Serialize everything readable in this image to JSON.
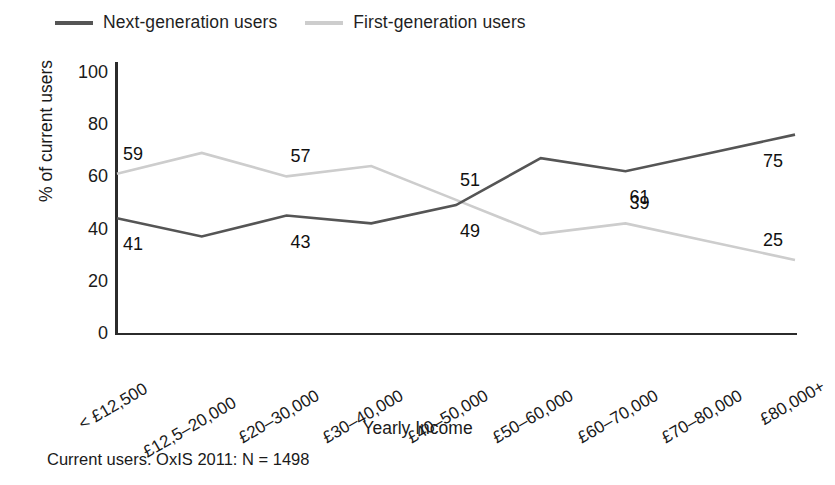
{
  "chart_data": {
    "type": "line",
    "title": "",
    "xlabel": "Yearly Income",
    "ylabel": "% of current users",
    "ylim": [
      0,
      100
    ],
    "yticks": [
      0,
      20,
      40,
      60,
      80,
      100
    ],
    "grid": false,
    "legend_position": "top-left",
    "categories": [
      "< £12,500",
      "£12,5–20,000",
      "£20–30,000",
      "£30–40,000",
      "£40–50,000",
      "£50–60,000",
      "£60–70,000",
      "£70–80,000",
      "£80,000+"
    ],
    "series": [
      {
        "name": "Next-generation users",
        "color": "#555555",
        "values": [
          44,
          37,
          45,
          42,
          49,
          67,
          62,
          69,
          76
        ],
        "labels": [
          {
            "index": 0,
            "text": "41"
          },
          {
            "index": 2,
            "text": "43"
          },
          {
            "index": 4,
            "text": "49"
          },
          {
            "index": 6,
            "text": "61"
          },
          {
            "index": 8,
            "text": "75"
          }
        ]
      },
      {
        "name": "First-generation users",
        "color": "#cdcdcd",
        "values": [
          61,
          69,
          60,
          64,
          51,
          38,
          42,
          35,
          28
        ],
        "labels": [
          {
            "index": 0,
            "text": "59"
          },
          {
            "index": 2,
            "text": "57"
          },
          {
            "index": 4,
            "text": "51"
          },
          {
            "index": 6,
            "text": "39"
          },
          {
            "index": 8,
            "text": "25"
          }
        ]
      }
    ],
    "annotations": [
      {
        "name": "footnote",
        "text": "Current users. OxIS 2011: N = 1498"
      }
    ]
  },
  "legend": {
    "entries": [
      {
        "label": "Next-generation users",
        "color": "#555555"
      },
      {
        "label": "First-generation users",
        "color": "#cdcdcd"
      }
    ]
  },
  "footnote": "Current users. OxIS 2011: N = 1498"
}
